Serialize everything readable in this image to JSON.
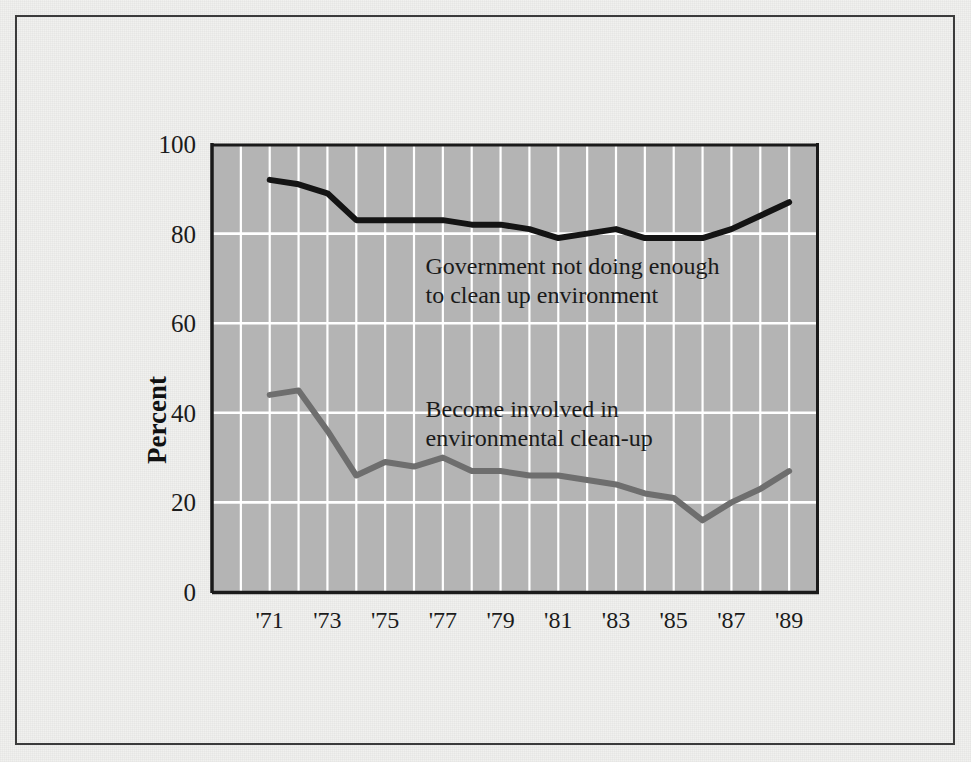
{
  "figure": {
    "background_color": "#f1f1ef",
    "frame_color": "#3c3c3c",
    "plot_background_color": "#b4b4b4",
    "gridline_color": "#ffffff",
    "axis_color": "#1a1a1a"
  },
  "chart_data": {
    "type": "line",
    "title": "",
    "xlabel": "",
    "ylabel": "Percent",
    "ylim": [
      0,
      100
    ],
    "yticks": [
      0,
      20,
      40,
      60,
      80,
      100
    ],
    "ytick_labels": [
      "0",
      "20",
      "40",
      "60",
      "80",
      "100"
    ],
    "xlim": [
      1969,
      1990
    ],
    "xticks": [
      1971,
      1973,
      1975,
      1977,
      1979,
      1981,
      1983,
      1985,
      1987,
      1989
    ],
    "xtick_labels": [
      "'71",
      "'73",
      "'75",
      "'77",
      "'79",
      "'81",
      "'83",
      "'85",
      "'87",
      "'89"
    ],
    "grid": "both axes, white gridlines on gray panel",
    "legend": "inline annotations next to each series",
    "x": [
      1971,
      1972,
      1973,
      1974,
      1975,
      1976,
      1977,
      1978,
      1979,
      1980,
      1981,
      1982,
      1983,
      1984,
      1985,
      1986,
      1987,
      1988,
      1989
    ],
    "series": [
      {
        "name": "Government not doing enough to clean up environment",
        "color": "#141414",
        "line_width": 6,
        "values": [
          92,
          91,
          89,
          83,
          83,
          83,
          83,
          82,
          82,
          81,
          79,
          80,
          81,
          79,
          79,
          79,
          81,
          84,
          87
        ]
      },
      {
        "name": "Become involved in environmental clean-up",
        "color": "#6e6e6e",
        "line_width": 6,
        "values": [
          44,
          45,
          36,
          26,
          29,
          28,
          30,
          27,
          27,
          26,
          26,
          25,
          24,
          22,
          21,
          16,
          20,
          23,
          27
        ]
      }
    ],
    "annotations": [
      {
        "name": "government-annotation",
        "lines": [
          "Government not doing enough",
          "to clean up environment"
        ],
        "x": 1976.4,
        "y": 71
      },
      {
        "name": "involvement-annotation",
        "lines": [
          "Become involved in",
          "environmental clean-up"
        ],
        "x": 1976.4,
        "y": 39
      }
    ]
  }
}
